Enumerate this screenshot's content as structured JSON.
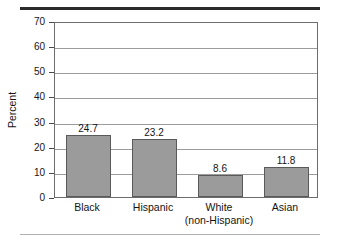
{
  "figure": {
    "name": "percent-by-race-ethnicity-bar-chart",
    "background_color": "#ffffff",
    "top_rule_color": "#2b2b2b",
    "bottom_rule_color": "#b0b0b0"
  },
  "chart_data": {
    "type": "bar",
    "title": "",
    "subtitle": "",
    "xlabel": "",
    "ylabel": "Percent",
    "categories": [
      "Black",
      "Hispanic",
      "White\n(non-Hispanic)",
      "Asian"
    ],
    "values": [
      24.7,
      23.2,
      8.6,
      11.8
    ],
    "value_labels": [
      "24.7",
      "23.2",
      "8.6",
      "11.8"
    ],
    "ylim": [
      0,
      70
    ],
    "ytick_values": [
      0,
      10,
      20,
      30,
      40,
      50,
      60,
      70
    ],
    "ytick_labels": [
      "0",
      "10",
      "20",
      "30",
      "40",
      "50",
      "60",
      "70"
    ],
    "grid": true,
    "grid_orientation": "horizontal",
    "legend": null,
    "legend_position": "none",
    "bar_fill_color": "#9b9b9b",
    "bar_edge_color": "#5a5a5a",
    "grid_color": "#9c9c9c",
    "axis_color": "#6d6d6d",
    "annotations": []
  }
}
